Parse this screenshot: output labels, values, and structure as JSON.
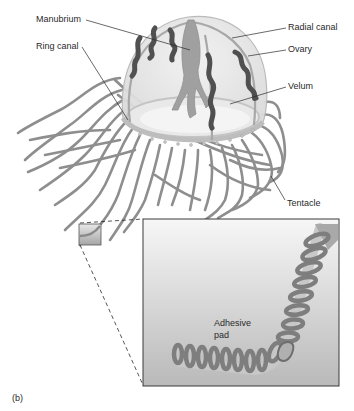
{
  "figure": {
    "panel_label": "(b)",
    "colors": {
      "tentacle": "#8c8c8c",
      "bell_fill": "#e6e6e6",
      "bell_edge": "#b5b5b5",
      "ovary": "#505050",
      "manubrium": "#9a9a9a",
      "velum": "#d8d8d8",
      "leader_line": "#2a2a2a",
      "inset_border": "#3a3a3a"
    }
  },
  "labels": {
    "manubrium": "Manubrium",
    "ring_canal": "Ring canal",
    "radial_canal": "Radial canal",
    "ovary": "Ovary",
    "velum": "Velum",
    "tentacle": "Tentacle",
    "adhesive_pad_line1": "Adhesive",
    "adhesive_pad_line2": "pad"
  },
  "inset": {
    "title": "Tentacle close-up showing adhesive pad",
    "source_region": "small box on tentacle"
  }
}
